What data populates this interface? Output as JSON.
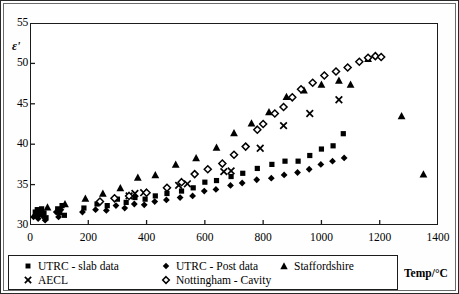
{
  "chart_data": {
    "type": "scatter",
    "title": "",
    "xlabel": "Temp/°C",
    "ylabel": "ε'",
    "xlim": [
      0,
      1400
    ],
    "ylim": [
      30,
      55
    ],
    "xticks": [
      0,
      200,
      400,
      600,
      800,
      1000,
      1200,
      1400
    ],
    "yticks": [
      30,
      35,
      40,
      45,
      50,
      55
    ],
    "grid": false,
    "legend_position": "bottom",
    "series": [
      {
        "name": "UTRC - slab data",
        "marker": "square",
        "color": "#000000",
        "points": [
          [
            18,
            31.6
          ],
          [
            25,
            31.9
          ],
          [
            32,
            31.3
          ],
          [
            40,
            32.0
          ],
          [
            48,
            31.5
          ],
          [
            55,
            30.9
          ],
          [
            95,
            32.0
          ],
          [
            102,
            31.5
          ],
          [
            110,
            32.4
          ],
          [
            118,
            31.2
          ],
          [
            185,
            32.1
          ],
          [
            230,
            32.6
          ],
          [
            265,
            32.4
          ],
          [
            300,
            33.2
          ],
          [
            330,
            32.8
          ],
          [
            360,
            33.4
          ],
          [
            395,
            33.2
          ],
          [
            430,
            33.6
          ],
          [
            470,
            33.9
          ],
          [
            520,
            34.2
          ],
          [
            560,
            34.6
          ],
          [
            600,
            35.3
          ],
          [
            640,
            35.5
          ],
          [
            690,
            36.0
          ],
          [
            730,
            36.4
          ],
          [
            780,
            37.0
          ],
          [
            830,
            37.5
          ],
          [
            875,
            37.9
          ],
          [
            920,
            37.9
          ],
          [
            960,
            38.6
          ],
          [
            1000,
            39.4
          ],
          [
            1040,
            39.8
          ],
          [
            1075,
            41.3
          ]
        ]
      },
      {
        "name": "UTRC - Post data",
        "marker": "diamond-filled",
        "color": "#000000",
        "points": [
          [
            12,
            31.0
          ],
          [
            20,
            31.3
          ],
          [
            28,
            30.8
          ],
          [
            36,
            31.8
          ],
          [
            44,
            31.1
          ],
          [
            52,
            30.6
          ],
          [
            90,
            31.6
          ],
          [
            98,
            31.0
          ],
          [
            106,
            31.9
          ],
          [
            180,
            31.6
          ],
          [
            225,
            31.9
          ],
          [
            262,
            31.8
          ],
          [
            295,
            32.4
          ],
          [
            325,
            32.1
          ],
          [
            358,
            32.6
          ],
          [
            392,
            32.5
          ],
          [
            428,
            32.9
          ],
          [
            468,
            33.1
          ],
          [
            515,
            33.4
          ],
          [
            558,
            33.6
          ],
          [
            598,
            34.2
          ],
          [
            638,
            34.4
          ],
          [
            688,
            34.9
          ],
          [
            728,
            35.2
          ],
          [
            778,
            35.6
          ],
          [
            828,
            35.8
          ],
          [
            872,
            36.2
          ],
          [
            918,
            36.5
          ],
          [
            958,
            36.9
          ],
          [
            998,
            37.5
          ],
          [
            1038,
            37.9
          ],
          [
            1078,
            38.3
          ]
        ]
      },
      {
        "name": "Staffordshire",
        "marker": "triangle",
        "color": "#000000",
        "points": [
          [
            60,
            32.2
          ],
          [
            120,
            32.6
          ],
          [
            190,
            33.3
          ],
          [
            250,
            33.9
          ],
          [
            310,
            34.6
          ],
          [
            370,
            35.9
          ],
          [
            430,
            36.2
          ],
          [
            500,
            37.5
          ],
          [
            570,
            38.3
          ],
          [
            640,
            39.6
          ],
          [
            700,
            41.4
          ],
          [
            760,
            42.6
          ],
          [
            820,
            44.0
          ],
          [
            880,
            45.9
          ],
          [
            940,
            46.7
          ],
          [
            1000,
            47.4
          ],
          [
            1060,
            47.9
          ],
          [
            1100,
            47.4
          ],
          [
            1160,
            50.6
          ],
          [
            1275,
            43.5
          ],
          [
            1350,
            36.3
          ]
        ]
      },
      {
        "name": "AECL",
        "marker": "cross",
        "color": "#000000",
        "points": [
          [
            340,
            33.6
          ],
          [
            360,
            33.9
          ],
          [
            390,
            34.0
          ],
          [
            510,
            34.9
          ],
          [
            540,
            35.1
          ],
          [
            665,
            36.6
          ],
          [
            690,
            36.7
          ],
          [
            790,
            39.5
          ],
          [
            870,
            42.3
          ],
          [
            960,
            43.8
          ],
          [
            1060,
            45.5
          ]
        ]
      },
      {
        "name": "Nottingham - Cavity",
        "marker": "diamond-open",
        "color": "#000000",
        "points": [
          [
            240,
            32.9
          ],
          [
            290,
            33.3
          ],
          [
            340,
            33.6
          ],
          [
            400,
            34.0
          ],
          [
            470,
            34.6
          ],
          [
            520,
            35.3
          ],
          [
            565,
            36.3
          ],
          [
            610,
            36.9
          ],
          [
            660,
            37.6
          ],
          [
            700,
            38.7
          ],
          [
            740,
            39.7
          ],
          [
            780,
            41.8
          ],
          [
            800,
            42.5
          ],
          [
            840,
            43.8
          ],
          [
            870,
            44.6
          ],
          [
            900,
            45.8
          ],
          [
            930,
            46.8
          ],
          [
            970,
            47.6
          ],
          [
            1010,
            48.5
          ],
          [
            1050,
            49.0
          ],
          [
            1090,
            49.5
          ],
          [
            1130,
            50.2
          ],
          [
            1160,
            50.7
          ],
          [
            1185,
            50.9
          ],
          [
            1205,
            50.8
          ]
        ]
      }
    ]
  },
  "axis": {
    "y_label": "ε'",
    "x_label": "Temp/°C",
    "y_ticks": [
      "55",
      "50",
      "45",
      "40",
      "35",
      "30"
    ],
    "x_ticks": [
      "0",
      "200",
      "400",
      "600",
      "800",
      "1000",
      "1200",
      "1400"
    ]
  },
  "legend": {
    "items": [
      {
        "label": "UTRC - slab data",
        "marker": "square"
      },
      {
        "label": "UTRC - Post data",
        "marker": "diamond-filled"
      },
      {
        "label": "Staffordshire",
        "marker": "triangle"
      },
      {
        "label": "AECL",
        "marker": "cross"
      },
      {
        "label": "Nottingham - Cavity",
        "marker": "diamond-open"
      }
    ]
  },
  "colors": {
    "ink": "#000000",
    "frame": "#1b1b1b"
  }
}
